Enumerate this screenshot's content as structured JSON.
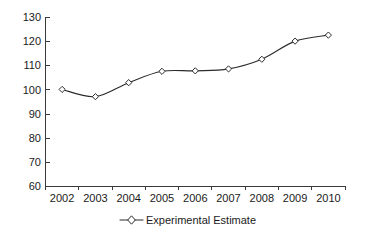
{
  "chart_data": {
    "type": "line",
    "title": "",
    "subtitle": "",
    "xlabel": "",
    "ylabel": "",
    "categories": [
      "2002",
      "2003",
      "2004",
      "2005",
      "2006",
      "2007",
      "2008",
      "2009",
      "2010"
    ],
    "series": [
      {
        "name": "Experimental Estimate",
        "values": [
          100,
          97,
          102.8,
          107.5,
          107.7,
          108.5,
          112.5,
          120,
          122.5
        ],
        "color": "#2b2b2b",
        "marker": "open-diamond"
      }
    ],
    "ylim": [
      60,
      130
    ],
    "ytick_step": 10,
    "ytick_labels": [
      "130",
      "120",
      "110",
      "100",
      "90",
      "80",
      "70",
      "60"
    ],
    "ytick_values": [
      130,
      120,
      110,
      100,
      90,
      80,
      70,
      60
    ],
    "grid": false,
    "legend_position": "bottom-center",
    "axis_color": "#3a3a3a"
  },
  "legend": {
    "entries": [
      {
        "label": "Experimental Estimate",
        "marker": "open-diamond-line"
      }
    ]
  }
}
